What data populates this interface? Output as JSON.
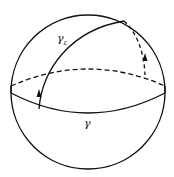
{
  "diagram": {
    "labels": {
      "gamma": "γ",
      "gamma_eps_base": "γ",
      "gamma_eps_sub": "ε"
    },
    "colors": {
      "stroke": "#111111",
      "background": "#ffffff"
    }
  }
}
